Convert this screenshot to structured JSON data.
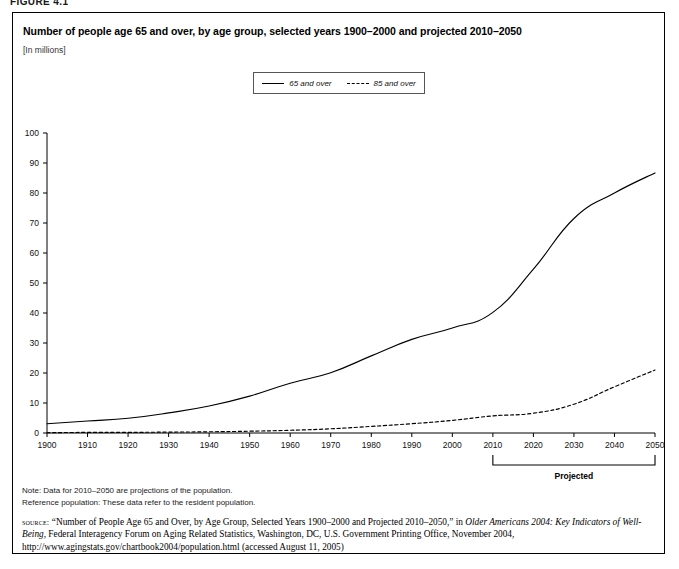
{
  "figure": {
    "number_label": "FIGURE 4.1"
  },
  "chart_title": "Number of people age 65 and over, by age group, selected years 1900–2000 and projected 2010–2050",
  "units_label": "[In millions]",
  "legend": {
    "entries": [
      {
        "label": "65 and over",
        "style": "solid"
      },
      {
        "label": "85 and over",
        "style": "dashed"
      }
    ]
  },
  "annotations": {
    "projected_label": "Projected",
    "projected_range_start": "2010",
    "projected_range_end": "2050"
  },
  "notes": [
    "Note: Data for 2010–2050 are projections of the population.",
    "Reference population: These data refer to the resident population."
  ],
  "source": {
    "label": "source:",
    "part1": "“Number of People Age 65 and Over, by Age Group, Selected Years 1900–2000 and Projected 2010–2050,” in ",
    "italic1": "Older Americans 2004: Key Indicators of Well-Being",
    "part2": ", Federal Interagency Forum on Aging Related Statistics, Washington, DC, U.S. Government Printing Office, November 2004, http://www.agingstats.gov/chartbook2004/population.html (accessed August 11, 2005)"
  },
  "chart_data": {
    "type": "line",
    "title": "Number of people age 65 and over, by age group, selected years 1900–2000 and projected 2010–2050",
    "subtitle": "[In millions]",
    "xlabel": "",
    "ylabel": "",
    "units": "millions",
    "grid": false,
    "legend_position": "top-center",
    "x": [
      1900,
      1910,
      1920,
      1930,
      1940,
      1950,
      1960,
      1970,
      1980,
      1990,
      2000,
      2010,
      2020,
      2030,
      2040,
      2050
    ],
    "xlim": [
      1900,
      2050
    ],
    "ylim": [
      0,
      100
    ],
    "ytick_step": 10,
    "yticks": [
      0,
      10,
      20,
      30,
      40,
      50,
      60,
      70,
      80,
      90,
      100
    ],
    "xticks": [
      1900,
      1910,
      1920,
      1930,
      1940,
      1950,
      1960,
      1970,
      1980,
      1990,
      2000,
      2010,
      2020,
      2030,
      2040,
      2050
    ],
    "series": [
      {
        "name": "65 and over",
        "style": "solid",
        "values": [
          3.1,
          4.0,
          4.9,
          6.7,
          9.0,
          12.3,
          16.6,
          20.1,
          25.7,
          31.2,
          35.0,
          40.2,
          54.6,
          71.5,
          80.0,
          86.7
        ]
      },
      {
        "name": "85 and over",
        "style": "dashed",
        "values": [
          0.1,
          0.2,
          0.2,
          0.3,
          0.4,
          0.6,
          0.9,
          1.4,
          2.2,
          3.1,
          4.2,
          5.7,
          6.6,
          9.6,
          15.4,
          21.0
        ]
      }
    ]
  }
}
